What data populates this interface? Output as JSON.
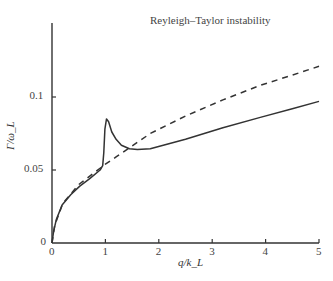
{
  "chart_data": {
    "type": "line",
    "title": "Reyleigh–Taylor instability",
    "xlabel": "q/k_L",
    "ylabel": "Γ/ω_L",
    "xlim": [
      0,
      5
    ],
    "ylim": [
      0,
      0.15
    ],
    "x_ticks": [
      "0",
      "1",
      "2",
      "3",
      "4",
      "5"
    ],
    "y_ticks": [
      "0",
      "0.05",
      "0.1"
    ],
    "grid": false,
    "legend": null,
    "series": [
      {
        "name": "solid",
        "style": "solid",
        "x": [
          0,
          0.03,
          0.08,
          0.19,
          0.35,
          0.52,
          0.7,
          0.9,
          0.95,
          0.97,
          0.99,
          1.02,
          1.06,
          1.12,
          1.2,
          1.3,
          1.45,
          1.6,
          1.84,
          2.5,
          3.2,
          3.9,
          4.5,
          5.0
        ],
        "y": [
          0,
          0.008,
          0.016,
          0.026,
          0.033,
          0.039,
          0.044,
          0.05,
          0.053,
          0.062,
          0.078,
          0.085,
          0.083,
          0.076,
          0.071,
          0.067,
          0.0645,
          0.064,
          0.0645,
          0.071,
          0.079,
          0.086,
          0.092,
          0.097
        ]
      },
      {
        "name": "dashed",
        "style": "dashed",
        "x": [
          0,
          0.05,
          0.2,
          0.5,
          0.75,
          1.0,
          1.2,
          1.4,
          1.84,
          2.5,
          3.2,
          3.9,
          4.5,
          5.0
        ],
        "y": [
          0,
          0.012,
          0.027,
          0.04,
          0.047,
          0.054,
          0.059,
          0.064,
          0.075,
          0.087,
          0.098,
          0.108,
          0.115,
          0.121
        ]
      }
    ]
  },
  "plot": {
    "x0_px": 52,
    "x1_px": 319,
    "y0_px": 243,
    "y_top_px": 23,
    "y_per_unit_px": 1460,
    "line_color": "#333333"
  }
}
